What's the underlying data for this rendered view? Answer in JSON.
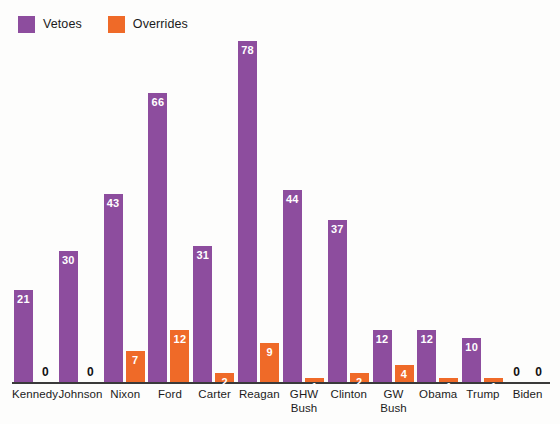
{
  "legend": {
    "position": "top-left",
    "entries": [
      {
        "label": "Vetoes",
        "color": "#8d4d9e",
        "swatch_name": "legend-swatch-vetoes"
      },
      {
        "label": "Overrides",
        "color": "#ef6a28",
        "swatch_name": "legend-swatch-overrides"
      }
    ]
  },
  "chart_data": {
    "type": "bar",
    "title": "",
    "subtitle": "",
    "xlabel": "",
    "ylabel": "",
    "ylim": [
      0,
      78
    ],
    "grid": false,
    "legend_position": "top-left",
    "axis_visible": {
      "x": true,
      "y": false
    },
    "tick_labels": {
      "y": []
    },
    "categories": [
      "Kennedy",
      "Johnson",
      "Nixon",
      "Ford",
      "Carter",
      "Reagan",
      "GHW Bush",
      "Clinton",
      "GW Bush",
      "Obama",
      "Trump",
      "Biden"
    ],
    "category_lines": [
      [
        "Kennedy"
      ],
      [
        "Johnson"
      ],
      [
        "Nixon"
      ],
      [
        "Ford"
      ],
      [
        "Carter"
      ],
      [
        "Reagan"
      ],
      [
        "GHW",
        "Bush"
      ],
      [
        "Clinton"
      ],
      [
        "GW",
        "Bush"
      ],
      [
        "Obama"
      ],
      [
        "Trump"
      ],
      [
        "Biden"
      ]
    ],
    "series": [
      {
        "name": "Vetoes",
        "color": "#8d4d9e",
        "values": [
          21,
          30,
          43,
          66,
          31,
          78,
          44,
          37,
          12,
          12,
          10,
          0
        ]
      },
      {
        "name": "Overrides",
        "color": "#ef6a28",
        "values": [
          0,
          0,
          7,
          12,
          2,
          9,
          1,
          2,
          4,
          1,
          1,
          0
        ]
      }
    ]
  },
  "colors": {
    "vetoes": "#8d4d9e",
    "overrides": "#ef6a28",
    "axis": "#3a3a3a",
    "value_label_on_bar": "#ffffff",
    "value_label_zero": "#111111",
    "background": "#fdfdfc"
  }
}
